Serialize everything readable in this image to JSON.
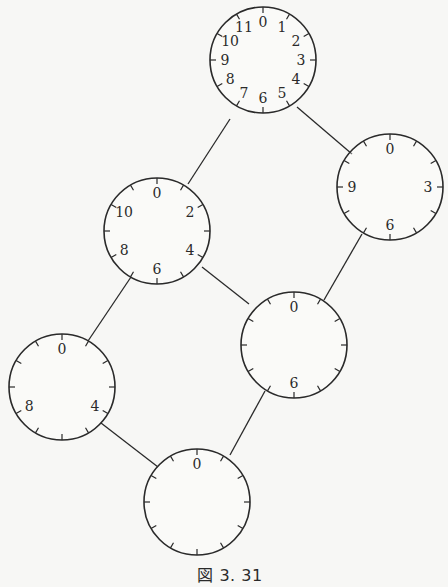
{
  "figure": {
    "caption": "図 3. 31",
    "stroke_color": "#2a2a2a",
    "background": "#f7f7f5"
  },
  "nodes": [
    {
      "id": "clock-12",
      "cx": 263,
      "cy": 60,
      "r": 53,
      "ticks": 12,
      "tick_labels": [
        "0",
        "1",
        "2",
        "3",
        "4",
        "5",
        "6",
        "7",
        "8",
        "9",
        "10",
        "11"
      ],
      "label_positions": [
        0,
        1,
        2,
        3,
        4,
        5,
        6,
        7,
        8,
        9,
        10,
        11
      ]
    },
    {
      "id": "clock-6",
      "cx": 157,
      "cy": 231,
      "r": 53,
      "ticks": 12,
      "tick_labels": [
        "0",
        "2",
        "4",
        "6",
        "8",
        "10"
      ],
      "label_positions": [
        0,
        2,
        4,
        6,
        8,
        10
      ]
    },
    {
      "id": "clock-4",
      "cx": 390,
      "cy": 187,
      "r": 53,
      "ticks": 12,
      "tick_labels": [
        "0",
        "3",
        "6",
        "9"
      ],
      "label_positions": [
        0,
        3,
        6,
        9
      ]
    },
    {
      "id": "clock-3",
      "cx": 62,
      "cy": 387,
      "r": 53,
      "ticks": 12,
      "tick_labels": [
        "0",
        "4",
        "8"
      ],
      "label_positions": [
        0,
        4,
        8
      ]
    },
    {
      "id": "clock-2",
      "cx": 294,
      "cy": 345,
      "r": 53,
      "ticks": 12,
      "tick_labels": [
        "0",
        "6"
      ],
      "label_positions": [
        0,
        6
      ]
    },
    {
      "id": "clock-1",
      "cx": 197,
      "cy": 502,
      "r": 53,
      "ticks": 12,
      "tick_labels": [
        "0"
      ],
      "label_positions": [
        0
      ]
    }
  ],
  "edges": [
    {
      "from": "clock-12",
      "to": "clock-6",
      "x1": 230,
      "y1": 119,
      "x2": 188,
      "y2": 184
    },
    {
      "from": "clock-12",
      "to": "clock-4",
      "x1": 297,
      "y1": 107,
      "x2": 352,
      "y2": 154
    },
    {
      "from": "clock-6",
      "to": "clock-3",
      "x1": 131,
      "y1": 277,
      "x2": 88,
      "y2": 341
    },
    {
      "from": "clock-6",
      "to": "clock-2",
      "x1": 202,
      "y1": 267,
      "x2": 249,
      "y2": 304
    },
    {
      "from": "clock-4",
      "to": "clock-2",
      "x1": 362,
      "y1": 234,
      "x2": 324,
      "y2": 300
    },
    {
      "from": "clock-3",
      "to": "clock-1",
      "x1": 101,
      "y1": 423,
      "x2": 158,
      "y2": 467
    },
    {
      "from": "clock-2",
      "to": "clock-1",
      "x1": 265,
      "y1": 391,
      "x2": 230,
      "y2": 455
    }
  ]
}
